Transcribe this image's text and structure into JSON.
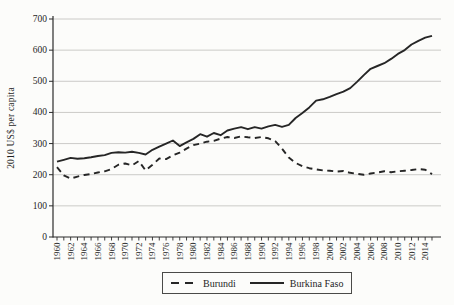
{
  "chart_data": {
    "type": "line",
    "title": "",
    "xlabel": "",
    "ylabel": "2010 US$ per capita",
    "ylim": [
      0,
      700
    ],
    "yticks": [
      0,
      100,
      200,
      300,
      400,
      500,
      600,
      700
    ],
    "x_range": [
      1960,
      2015
    ],
    "xtick_labels": [
      "1960",
      "1962",
      "1964",
      "1966",
      "1968",
      "1970",
      "1972",
      "1974",
      "1976",
      "1978",
      "1980",
      "1982",
      "1984",
      "1986",
      "1988",
      "1990",
      "1992",
      "1994",
      "1996",
      "1998",
      "2000",
      "2002",
      "2004",
      "2006",
      "2008",
      "2010",
      "2012",
      "2014"
    ],
    "grid": "horizontal",
    "legend_position": "bottom-center",
    "years": [
      1960,
      1961,
      1962,
      1963,
      1964,
      1965,
      1966,
      1967,
      1968,
      1969,
      1970,
      1971,
      1972,
      1973,
      1974,
      1975,
      1976,
      1977,
      1978,
      1979,
      1980,
      1981,
      1982,
      1983,
      1984,
      1985,
      1986,
      1987,
      1988,
      1989,
      1990,
      1991,
      1992,
      1993,
      1994,
      1995,
      1996,
      1997,
      1998,
      1999,
      2000,
      2001,
      2002,
      2003,
      2004,
      2005,
      2006,
      2007,
      2008,
      2009,
      2010,
      2011,
      2012,
      2013,
      2014,
      2015
    ],
    "series": [
      {
        "name": "Burundi",
        "style": "dashed",
        "color": "#262626",
        "values": [
          224,
          198,
          188,
          194,
          199,
          202,
          207,
          211,
          218,
          232,
          236,
          230,
          244,
          214,
          232,
          252,
          250,
          262,
          271,
          284,
          295,
          300,
          306,
          309,
          316,
          321,
          318,
          323,
          320,
          318,
          321,
          317,
          308,
          284,
          255,
          238,
          227,
          221,
          217,
          214,
          213,
          210,
          212,
          206,
          203,
          200,
          204,
          207,
          211,
          208,
          211,
          213,
          215,
          218,
          216,
          202
        ]
      },
      {
        "name": "Burkina Faso",
        "style": "solid",
        "color": "#262626",
        "values": [
          242,
          248,
          254,
          251,
          253,
          256,
          260,
          263,
          270,
          272,
          271,
          274,
          270,
          265,
          280,
          290,
          300,
          310,
          292,
          304,
          315,
          330,
          322,
          334,
          327,
          342,
          348,
          353,
          346,
          353,
          348,
          355,
          360,
          354,
          360,
          382,
          398,
          416,
          438,
          442,
          450,
          459,
          467,
          478,
          498,
          520,
          540,
          549,
          558,
          572,
          588,
          600,
          618,
          630,
          640,
          646
        ]
      }
    ],
    "colors": {
      "axis": "#2b2b2b",
      "gridline": "#c6c5c2",
      "tick_text": "#1f1f1f",
      "background": "#fcfcfa"
    }
  }
}
